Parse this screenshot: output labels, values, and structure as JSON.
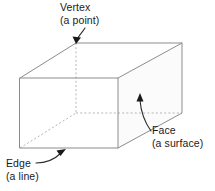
{
  "figure": {
    "background_color": "#ffffff",
    "edge_color": "#8c8c8c",
    "hidden_edge_color": "#b5b5b5",
    "face_shade_color": "#fbfbfb",
    "annotation_color": "#1a1a1a",
    "solid": {
      "name": "cuboid",
      "vertices": {
        "front_top_left": [
          20,
          78
        ],
        "front_top_right": [
          118,
          78
        ],
        "front_bottom_left": [
          20,
          148
        ],
        "front_bottom_right": [
          118,
          148
        ],
        "rear_top_left": [
          76,
          43
        ],
        "rear_top_right": [
          182,
          43
        ],
        "rear_bottom_left": [
          76,
          113
        ],
        "rear_bottom_right": [
          182,
          113
        ]
      },
      "hidden_vertex": "rear_bottom_left",
      "shaded_face": "right"
    },
    "annotations": [
      {
        "id": "vertex",
        "label_line1": "Vertex",
        "label_line2": "(a point)",
        "points_to": "rear_top_left",
        "label_x": 60,
        "label_y": 11,
        "label_y2": 24
      },
      {
        "id": "face",
        "label_line1": "Face",
        "label_line2": "(a surface)",
        "points_to": "right-face",
        "label_x": 152,
        "label_y": 134,
        "label_y2": 147
      },
      {
        "id": "edge",
        "label_line1": "Edge",
        "label_line2": "(a line)",
        "points_to": "front-bottom-edge",
        "label_x": 6,
        "label_y": 167,
        "label_y2": 180
      }
    ]
  }
}
